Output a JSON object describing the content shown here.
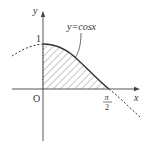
{
  "figure": {
    "type": "function-graph",
    "function_label": "y=cosx",
    "axes": {
      "x_label": "x",
      "y_label": "y",
      "origin_label": "O"
    },
    "ticks": {
      "y_one": "1",
      "x_pi_over_2": {
        "numerator": "π",
        "denominator": "2"
      }
    },
    "shaded_region": {
      "description": "area under y=cos x from x=0 to x=π/2",
      "x_from": "0",
      "x_to": "π/2",
      "pattern": "diagonal-hatch"
    },
    "colors": {
      "axis": "#444444",
      "curve": "#333333",
      "hatch": "#777777",
      "text": "#333333"
    }
  }
}
